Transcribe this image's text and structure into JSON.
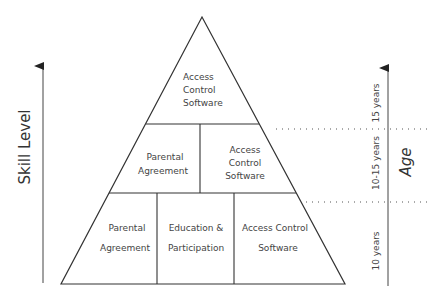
{
  "diagram": {
    "type": "pyramid",
    "tiers": [
      {
        "name": "top",
        "age_band": "15 years",
        "cells": [
          {
            "lines": [
              "Access",
              "Control",
              "Software"
            ]
          }
        ]
      },
      {
        "name": "middle",
        "age_band": "10-15 years",
        "cells": [
          {
            "lines": [
              "Parental",
              "Agreement"
            ]
          },
          {
            "lines": [
              "Access",
              "Control",
              "Software"
            ]
          }
        ]
      },
      {
        "name": "bottom",
        "age_band": "10 years",
        "cells": [
          {
            "lines": [
              "Parental",
              "Agreement"
            ]
          },
          {
            "lines": [
              "Education &",
              "Participation"
            ]
          },
          {
            "lines": [
              "Access Control",
              "Software"
            ]
          }
        ]
      }
    ],
    "left_axis": {
      "label": "Skill Level"
    },
    "right_axis": {
      "label": "Age",
      "bands": [
        "15 years",
        "10-15 years",
        "10 years"
      ]
    },
    "colors": {
      "line": "#333333",
      "text": "#444444",
      "background": "#ffffff"
    }
  }
}
